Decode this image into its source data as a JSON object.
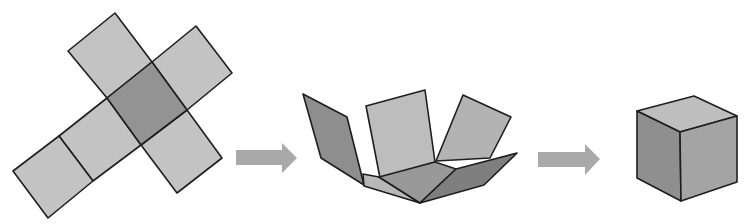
{
  "title_cropped": "",
  "colors": {
    "net_face": "#c3c3c3",
    "net_center_face": "#939393",
    "arrow": "#a9a9a9",
    "fold_left_flap": "#8e8e8e",
    "fold_back_flap": "#bdbdbd",
    "fold_right_flap": "#b3b3b3",
    "fold_base": "#999999",
    "fold_far_right_flap": "#7f7f7f",
    "fold_front_strip": "#b8b8b8",
    "cube_top": "#bebebe",
    "cube_left": "#8f8f8f",
    "cube_right": "#a4a4a4",
    "edge": "#1e1e1e"
  },
  "steps": [
    {
      "id": "unfolded-net",
      "label": "Cube net (cross shape, 6 squares)"
    },
    {
      "id": "arrow-1",
      "label": "arrow"
    },
    {
      "id": "partially-folded",
      "label": "Net folding up"
    },
    {
      "id": "arrow-2",
      "label": "arrow"
    },
    {
      "id": "cube",
      "label": "Folded cube"
    }
  ]
}
